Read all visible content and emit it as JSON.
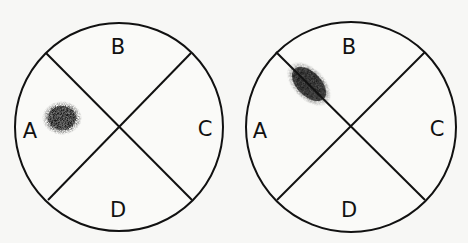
{
  "diagrams": [
    {
      "name": "left-plate",
      "labels": {
        "top": "B",
        "left": "A",
        "right": "C",
        "bottom": "D"
      },
      "spot_region": "A",
      "spot_description": "round dark spot inside region A"
    },
    {
      "name": "right-plate",
      "labels": {
        "top": "B",
        "left": "A",
        "right": "C",
        "bottom": "D"
      },
      "spot_region": "A/B boundary",
      "spot_description": "elongated dark spot lying on the dividing line between A and B"
    }
  ],
  "colors": {
    "line": "#111111",
    "spot": "#1a1a1a",
    "background": "#f7f7f5"
  }
}
